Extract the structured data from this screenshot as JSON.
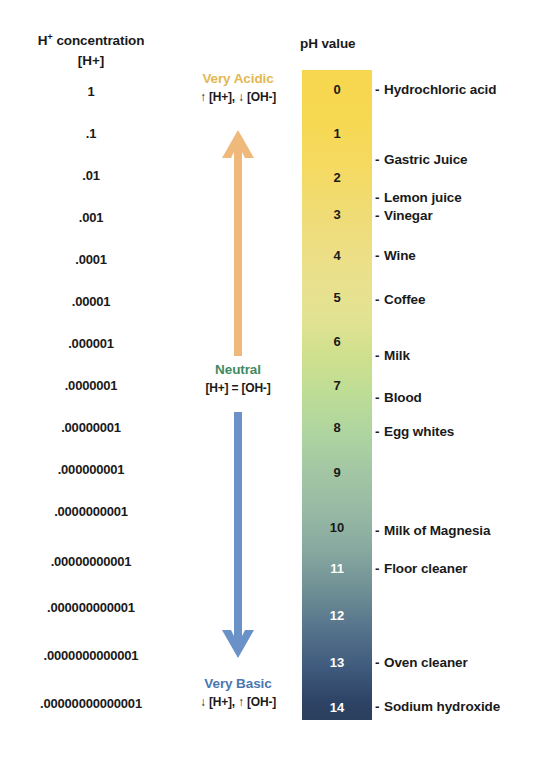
{
  "left_column": {
    "header_line1_prefix": "H",
    "header_line1_sup": "+",
    "header_line1_suffix": " concentration",
    "header_line2_prefix": "[H",
    "header_line2_sup": "+",
    "header_line2_suffix": "]",
    "values": [
      {
        "text": "1",
        "top": 84
      },
      {
        "text": ".1",
        "top": 126
      },
      {
        "text": ".01",
        "top": 168
      },
      {
        "text": ".001",
        "top": 210
      },
      {
        "text": ".0001",
        "top": 252
      },
      {
        "text": ".00001",
        "top": 294
      },
      {
        "text": ".000001",
        "top": 336
      },
      {
        "text": ".0000001",
        "top": 378
      },
      {
        "text": ".00000001",
        "top": 420
      },
      {
        "text": ".000000001",
        "top": 462
      },
      {
        "text": ".0000000001",
        "top": 504
      },
      {
        "text": ".00000000001",
        "top": 554
      },
      {
        "text": ".000000000001",
        "top": 600
      },
      {
        "text": ".0000000000001",
        "top": 648
      },
      {
        "text": ".00000000000001",
        "top": 696
      }
    ]
  },
  "middle_column": {
    "acidic": {
      "title": "Very Acidic",
      "subtitle": "↑ [H+], ↓ [OH-]",
      "color": "#e3b84f",
      "arrow_icon": "arrow-up-icon",
      "arrow_color": "#eeb97a"
    },
    "neutral": {
      "title": "Neutral",
      "subtitle": "[H+] = [OH-]",
      "color": "#3f8a62"
    },
    "basic": {
      "title": "Very Basic",
      "subtitle": "↓ [H+], ↑ [OH-]",
      "color": "#4a77b0",
      "arrow_icon": "arrow-down-icon",
      "arrow_color": "#6b92c8"
    }
  },
  "ph_column": {
    "header": "pH value",
    "gradient_top_color": "#f7d74e",
    "gradient_mid_color": "#bcdd96",
    "gradient_bottom_color": "#2b3f5e",
    "numbers": [
      {
        "label": "0",
        "top": 82,
        "light": false
      },
      {
        "label": "1",
        "top": 126,
        "light": false
      },
      {
        "label": "2",
        "top": 170,
        "light": false
      },
      {
        "label": "3",
        "top": 207,
        "light": false
      },
      {
        "label": "4",
        "top": 248,
        "light": false
      },
      {
        "label": "5",
        "top": 290,
        "light": false
      },
      {
        "label": "6",
        "top": 334,
        "light": false
      },
      {
        "label": "7",
        "top": 378,
        "light": false
      },
      {
        "label": "8",
        "top": 420,
        "light": false
      },
      {
        "label": "9",
        "top": 465,
        "light": false
      },
      {
        "label": "10",
        "top": 520,
        "light": false
      },
      {
        "label": "11",
        "top": 561,
        "light": true
      },
      {
        "label": "12",
        "top": 608,
        "light": true
      },
      {
        "label": "13",
        "top": 655,
        "light": true
      },
      {
        "label": "14",
        "top": 700,
        "light": true
      }
    ],
    "substances": [
      {
        "name": "Hydrochloric acid",
        "top": 82
      },
      {
        "name": "Gastric Juice",
        "top": 152
      },
      {
        "name": "Lemon juice",
        "top": 190
      },
      {
        "name": "Vinegar",
        "top": 208
      },
      {
        "name": "Wine",
        "top": 248
      },
      {
        "name": "Coffee",
        "top": 292
      },
      {
        "name": "Milk",
        "top": 348
      },
      {
        "name": "Blood",
        "top": 390
      },
      {
        "name": "Egg whites",
        "top": 424
      },
      {
        "name": "Milk of Magnesia",
        "top": 523
      },
      {
        "name": "Floor cleaner",
        "top": 561
      },
      {
        "name": "Oven cleaner",
        "top": 655
      },
      {
        "name": "Sodium hydroxide",
        "top": 699
      }
    ],
    "dash": "-"
  }
}
